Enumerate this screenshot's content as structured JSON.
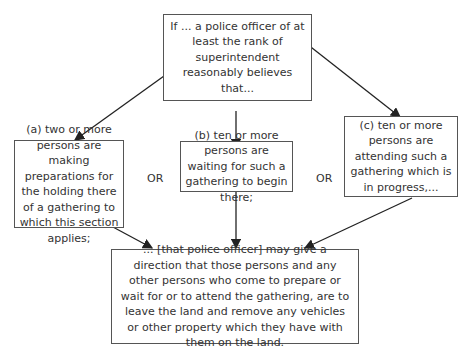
{
  "diagram": {
    "top": "If ... a police officer of at least the rank of superintendent reasonably believes that...",
    "conditions": [
      {
        "text": "(a) two or more persons are making preparations for the holding there of a gathering to which this section applies;"
      },
      {
        "text": "(b) ten or more persons are waiting for such a gathering to begin there;"
      },
      {
        "text": "(c) ten or more persons are attending such a gathering which is in progress,..."
      }
    ],
    "or_labels": [
      "OR",
      "OR"
    ],
    "result": "... [that police officer] may give a direction that those persons and any other persons who come to prepare or wait for or to attend the gathering, are to leave the land and remove any vehicles or other property which they have with them on the land."
  }
}
